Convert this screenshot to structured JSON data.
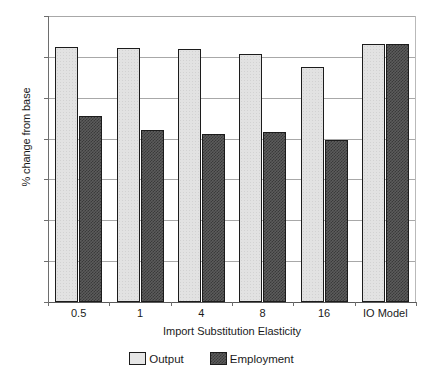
{
  "chart_data": {
    "type": "bar",
    "title": "",
    "xlabel": "Import Substitution Elasticity",
    "ylabel": "% change from base",
    "categories": [
      "0.5",
      "1",
      "4",
      "8",
      "16",
      "IO Model"
    ],
    "series": [
      {
        "name": "Output",
        "color": "#e2e2e2",
        "values": [
          0.625,
          0.622,
          0.62,
          0.606,
          0.574,
          0.632
        ]
      },
      {
        "name": "Employment",
        "color": "#5c5c5c",
        "values": [
          0.455,
          0.42,
          0.411,
          0.415,
          0.397,
          0.632
        ]
      }
    ],
    "ylim": [
      0,
      0.7
    ],
    "ytick_values": [
      0,
      0.1,
      0.2,
      0.3,
      0.4,
      0.5,
      0.6,
      0.7
    ],
    "ytick_labels": [
      "0",
      "0.1",
      "0.2",
      "0.3",
      "0.4",
      "0.5",
      "0.6",
      "0.7"
    ],
    "grid": true,
    "grid_axis": "y",
    "legend_position": "bottom"
  },
  "legend": {
    "entries": [
      {
        "label": "Output"
      },
      {
        "label": "Employment"
      }
    ]
  }
}
